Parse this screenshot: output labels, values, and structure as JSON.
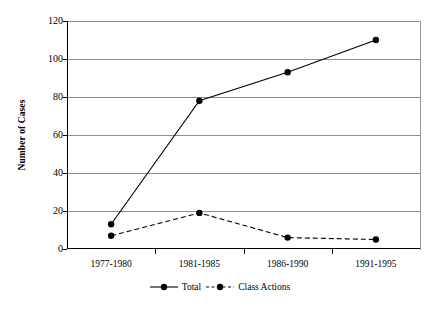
{
  "chart_data": {
    "type": "line",
    "title": "",
    "xlabel": "",
    "ylabel": "Number of Cases",
    "categories": [
      "1977-1980",
      "1981-1985",
      "1986-1990",
      "1991-1995"
    ],
    "series": [
      {
        "name": "Total",
        "values": [
          13,
          78,
          93,
          110
        ],
        "style": "solid",
        "marker": "circle",
        "color": "#000000"
      },
      {
        "name": "Class Actions",
        "values": [
          7,
          19,
          6,
          5
        ],
        "style": "dashed",
        "marker": "circle",
        "color": "#000000"
      }
    ],
    "ylim": [
      0,
      120
    ],
    "yticks": [
      0,
      20,
      40,
      60,
      80,
      100,
      120
    ],
    "ytick_labels": [
      "0",
      "20",
      "40",
      "60",
      "80",
      "100",
      "120"
    ],
    "grid": "horizontal",
    "legend_position": "bottom",
    "legend": [
      "Total",
      "Class Actions"
    ]
  },
  "axis": {
    "y_title": "Number of Cases"
  },
  "colors": {
    "line": "#000000",
    "grid": "#8d8d8d",
    "axis": "#000000",
    "background": "#ffffff"
  }
}
